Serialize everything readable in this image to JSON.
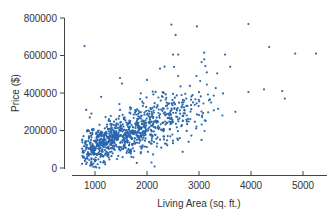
{
  "chart_data": {
    "type": "scatter",
    "title": "",
    "xlabel": "Living Area (sq. ft.)",
    "ylabel": "Price ($)",
    "xlim": [
      700,
      5300
    ],
    "ylim": [
      0,
      800000
    ],
    "x_ticks": [
      1000,
      2000,
      3000,
      4000,
      5000
    ],
    "x_tick_labels": [
      "1000",
      "2000",
      "3000",
      "4000",
      "5000"
    ],
    "y_ticks": [
      0,
      200000,
      400000,
      600000,
      800000
    ],
    "y_tick_labels": [
      "0",
      "200000",
      "400000",
      "600000",
      "800000"
    ],
    "grid": false,
    "legend": null,
    "point_color": "#2a67ad",
    "trend": "positive linear association; dense cluster ~900-2500 sq ft at $80k-$300k, spreading upward",
    "approx_point_count": 1000,
    "clusters": [
      {
        "x_center": 1100,
        "x_sd": 200,
        "y_center": 130000,
        "y_sd": 45000,
        "n": 300
      },
      {
        "x_center": 1600,
        "x_sd": 300,
        "y_center": 175000,
        "y_sd": 55000,
        "n": 350
      },
      {
        "x_center": 2200,
        "x_sd": 350,
        "y_center": 240000,
        "y_sd": 70000,
        "n": 250
      },
      {
        "x_center": 2800,
        "x_sd": 300,
        "y_center": 310000,
        "y_sd": 80000,
        "n": 80
      }
    ],
    "outliers": [
      {
        "x": 800,
        "y": 650000
      },
      {
        "x": 2470,
        "y": 765000
      },
      {
        "x": 2960,
        "y": 755000
      },
      {
        "x": 3950,
        "y": 768000
      },
      {
        "x": 2550,
        "y": 710000
      },
      {
        "x": 2500,
        "y": 605000
      },
      {
        "x": 2600,
        "y": 605000
      },
      {
        "x": 3100,
        "y": 615000
      },
      {
        "x": 3500,
        "y": 605000
      },
      {
        "x": 3100,
        "y": 580000
      },
      {
        "x": 3050,
        "y": 565000
      },
      {
        "x": 2520,
        "y": 540000
      },
      {
        "x": 3600,
        "y": 540000
      },
      {
        "x": 4350,
        "y": 645000
      },
      {
        "x": 4850,
        "y": 610000
      },
      {
        "x": 5250,
        "y": 610000
      },
      {
        "x": 3350,
        "y": 505000
      },
      {
        "x": 2600,
        "y": 490000
      },
      {
        "x": 3150,
        "y": 510000
      },
      {
        "x": 2950,
        "y": 490000
      },
      {
        "x": 3950,
        "y": 405000
      },
      {
        "x": 4250,
        "y": 420000
      },
      {
        "x": 4600,
        "y": 410000
      },
      {
        "x": 4650,
        "y": 370000
      },
      {
        "x": 3700,
        "y": 300000
      },
      {
        "x": 3450,
        "y": 280000
      },
      {
        "x": 3050,
        "y": 150000
      },
      {
        "x": 2800,
        "y": 140000
      },
      {
        "x": 1700,
        "y": 60000
      },
      {
        "x": 1050,
        "y": 20000
      },
      {
        "x": 1000,
        "y": 35000
      },
      {
        "x": 830,
        "y": 310000
      },
      {
        "x": 900,
        "y": 270000
      },
      {
        "x": 930,
        "y": 290000
      },
      {
        "x": 1120,
        "y": 380000
      },
      {
        "x": 1520,
        "y": 450000
      },
      {
        "x": 1480,
        "y": 480000
      },
      {
        "x": 2000,
        "y": 470000
      },
      {
        "x": 2250,
        "y": 530000
      }
    ]
  }
}
